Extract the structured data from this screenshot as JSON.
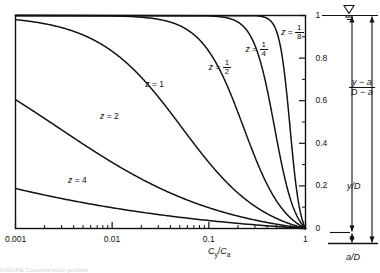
{
  "figure": {
    "caption_fragment": "FIGURE   Concentration profiles"
  },
  "axes": {
    "x": {
      "label_parts": {
        "c": "C",
        "y_sub": "y",
        "slash": "/",
        "ca": "C",
        "a_sub": "a"
      },
      "label_text": "Cy/Ca",
      "scale": "log",
      "min": 0.001,
      "max": 1,
      "tick_labels": [
        "0.001",
        "0.01",
        "0.1",
        "1"
      ],
      "tick_values": [
        0.001,
        0.01,
        0.1,
        1
      ]
    },
    "y": {
      "label_numerator": "y − a",
      "label_denominator": "D − a",
      "scale": "linear",
      "min": 0,
      "max": 1,
      "tick_labels": [
        "0",
        "0.2",
        "0.4",
        "0.6",
        "0.8",
        "1"
      ],
      "tick_values": [
        0,
        0.2,
        0.4,
        0.6,
        0.8,
        1
      ]
    }
  },
  "annotations": {
    "water_surface_symbol": "water-surface-triangle",
    "y_over_D": "y/D",
    "a_over_D": "a/D",
    "depth_ratio_numerator": "y − a",
    "depth_ratio_denominator": "D − a"
  },
  "chart_data": {
    "type": "line",
    "title": "",
    "xlabel": "Cy/Ca",
    "ylabel": "(y - a)/(D - a)",
    "xscale": "log",
    "xlim": [
      0.001,
      1
    ],
    "ylim": [
      0,
      1
    ],
    "grid": false,
    "legend": "inline-curve-labels",
    "equation": "Cy/Ca = [ ((D-y)/y) * (a/(D-a)) ]^z",
    "a_over_D": 0.05,
    "series": [
      {
        "name": "z = 4",
        "z": 4,
        "label": "z = 4",
        "label_x": 0.0035,
        "label_y": 0.225,
        "points_x": [
          0.001,
          0.0017,
          0.003,
          0.0055,
          0.01,
          0.018,
          0.032,
          0.056,
          0.1,
          0.18,
          0.32,
          0.56,
          1.0
        ],
        "points_y": [
          0.196,
          0.166,
          0.14,
          0.117,
          0.097,
          0.079,
          0.063,
          0.049,
          0.036,
          0.025,
          0.015,
          0.007,
          0.0
        ]
      },
      {
        "name": "z = 2",
        "z": 2,
        "label": "z = 2",
        "label_x": 0.0075,
        "label_y": 0.525,
        "points_x": [
          0.001,
          0.0017,
          0.003,
          0.0055,
          0.01,
          0.018,
          0.032,
          0.056,
          0.1,
          0.18,
          0.32,
          0.56,
          1.0
        ],
        "points_y": [
          0.637,
          0.566,
          0.494,
          0.425,
          0.358,
          0.294,
          0.235,
          0.18,
          0.13,
          0.086,
          0.05,
          0.021,
          0.0
        ]
      },
      {
        "name": "z = 1",
        "z": 1,
        "label": "z = 1",
        "label_x": 0.022,
        "label_y": 0.675,
        "points_x": [
          0.001,
          0.0017,
          0.003,
          0.0055,
          0.01,
          0.018,
          0.032,
          0.056,
          0.1,
          0.18,
          0.32,
          0.56,
          1.0
        ],
        "points_y": [
          0.994,
          0.99,
          0.982,
          0.969,
          0.947,
          0.908,
          0.845,
          0.748,
          0.613,
          0.443,
          0.266,
          0.115,
          0.0
        ]
      },
      {
        "name": "z = 1/2",
        "z": 0.5,
        "label": "z = 1/2",
        "label_x": 0.1,
        "label_y": 0.77,
        "points_x": [
          0.001,
          0.01,
          0.032,
          0.1,
          0.18,
          0.25,
          0.32,
          0.42,
          0.56,
          0.72,
          0.85,
          1.0
        ],
        "points_y": [
          1.0,
          0.9985,
          0.993,
          0.965,
          0.925,
          0.88,
          0.825,
          0.73,
          0.585,
          0.385,
          0.205,
          0.0
        ]
      },
      {
        "name": "z = 1/4",
        "z": 0.25,
        "label": "z = 1/4",
        "label_x": 0.24,
        "label_y": 0.855,
        "points_x": [
          0.001,
          0.01,
          0.1,
          0.25,
          0.42,
          0.56,
          0.68,
          0.78,
          0.86,
          0.92,
          0.96,
          1.0
        ],
        "points_y": [
          1.0,
          1.0,
          0.9995,
          0.997,
          0.987,
          0.968,
          0.93,
          0.865,
          0.76,
          0.6,
          0.4,
          0.0
        ]
      },
      {
        "name": "z = 1/8",
        "z": 0.125,
        "label": "z = 1/8",
        "label_x": 0.56,
        "label_y": 0.935,
        "points_x": [
          0.001,
          0.1,
          0.5,
          0.7,
          0.82,
          0.89,
          0.935,
          0.962,
          0.978,
          0.99,
          1.0
        ],
        "points_y": [
          1.0,
          1.0,
          1.0,
          0.9995,
          0.998,
          0.993,
          0.982,
          0.96,
          0.91,
          0.76,
          0.0
        ]
      }
    ]
  }
}
